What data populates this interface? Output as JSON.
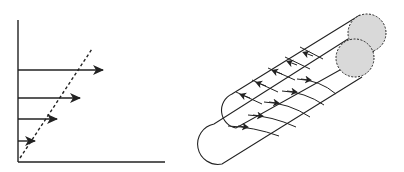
{
  "figure": {
    "left_panel": {
      "description": "velocity profile with linear increase",
      "axes": {
        "origin": [
          18,
          162
        ],
        "y_axis_top": [
          18,
          20
        ],
        "x_axis_right": [
          165,
          162
        ]
      },
      "velocity_arrows": [
        {
          "y": 70,
          "length": 85
        },
        {
          "y": 98,
          "length": 62
        },
        {
          "y": 119,
          "length": 39
        },
        {
          "y": 141,
          "length": 17
        }
      ],
      "dashed_line": {
        "from": [
          20,
          158
        ],
        "to": [
          92,
          49
        ]
      }
    },
    "right_panel": {
      "description": "two parallel cylinders with helical flow lines",
      "end_fill_color": "#d9d9d9",
      "stroke_color": "#222222"
    }
  }
}
